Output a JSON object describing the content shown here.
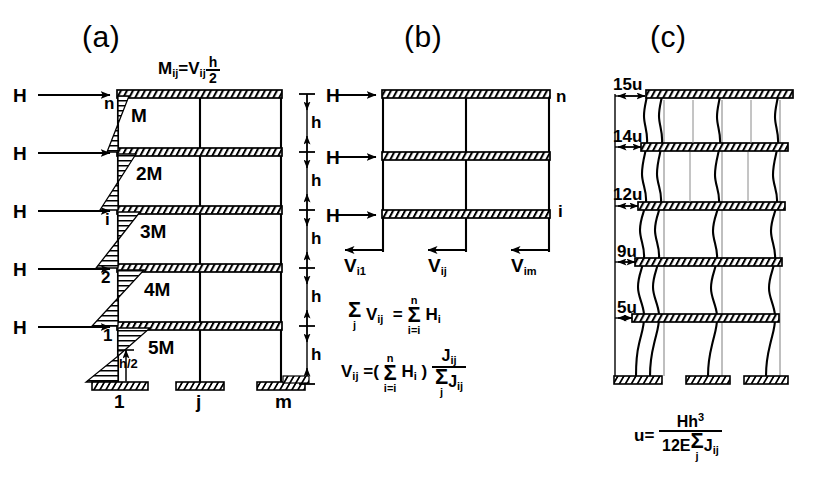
{
  "figure": {
    "panels": [
      {
        "id": "a",
        "title": "(a)"
      },
      {
        "id": "b",
        "title": "(b)"
      },
      {
        "id": "c",
        "title": "(c)"
      }
    ]
  },
  "panel_a": {
    "title": "(a)",
    "equation_top": {
      "lhs": "M",
      "lhs_sub": "ij",
      "eq": "=",
      "rhs": "V",
      "rhs_sub": "ij",
      "frac_num": "h",
      "frac_den": "2"
    },
    "loads": [
      "H",
      "H",
      "H",
      "H",
      "H"
    ],
    "floor_labels": [
      "n",
      "i",
      "2",
      "1"
    ],
    "moment_labels": [
      "M",
      "2M",
      "3M",
      "4M",
      "5M"
    ],
    "base_labels": [
      "1",
      "j",
      "m"
    ],
    "half_height_label": {
      "num": "h",
      "den": "2"
    },
    "storey_label": "h",
    "storey_count": 5
  },
  "panel_b": {
    "title": "(b)",
    "loads": [
      "H",
      "H",
      "H"
    ],
    "node_labels": [
      "n",
      "i"
    ],
    "shear_labels": [
      {
        "sym": "V",
        "sub": "i1"
      },
      {
        "sym": "V",
        "sub": "ij"
      },
      {
        "sym": "V",
        "sub": "im"
      }
    ],
    "equation_1": {
      "sum1_sym": "Σ",
      "sum1_bot": "j",
      "term1": "V",
      "term1_sub": "ij",
      "eq": "=",
      "sum2_sym": "Σ",
      "sum2_top": "n",
      "sum2_bot": "i=i",
      "term2": "H",
      "term2_sub": "i"
    },
    "equation_2": {
      "lhs": "V",
      "lhs_sub": "ij",
      "eq": "=(",
      "sum_sym": "Σ",
      "sum_top": "n",
      "sum_bot": "i=i",
      "term": "H",
      "term_sub": "i",
      "close": ")",
      "num": "J",
      "num_sub": "ij",
      "den_sum": "Σ",
      "den_sum_bot": "j",
      "den": "J",
      "den_sub": "ij"
    }
  },
  "panel_c": {
    "title": "(c)",
    "deflection_labels": [
      "15u",
      "14u",
      "12u",
      "9u",
      "5u"
    ],
    "equation": {
      "lhs": "u=",
      "num_H": "H",
      "num_h": "h",
      "num_exp": "3",
      "den_pre": "12E",
      "den_sum": "Σ",
      "den_sum_bot": "j",
      "den_J": "J",
      "den_J_sub": "ij"
    }
  },
  "style": {
    "ink": "#000000",
    "hatch": "#000000",
    "paper": "#ffffff",
    "faint_line": "#8a8a8a"
  }
}
